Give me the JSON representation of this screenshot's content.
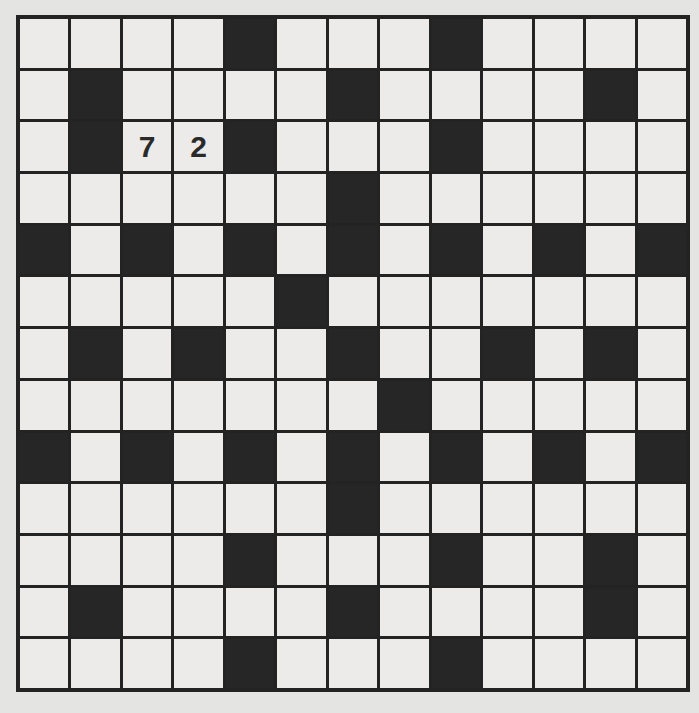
{
  "puzzle": {
    "type": "crossword",
    "rows": 13,
    "cols": 13,
    "black_cells": [
      [
        0,
        4
      ],
      [
        0,
        8
      ],
      [
        1,
        1
      ],
      [
        1,
        6
      ],
      [
        1,
        11
      ],
      [
        2,
        1
      ],
      [
        2,
        4
      ],
      [
        2,
        8
      ],
      [
        3,
        6
      ],
      [
        4,
        0
      ],
      [
        4,
        2
      ],
      [
        4,
        4
      ],
      [
        4,
        6
      ],
      [
        4,
        8
      ],
      [
        4,
        10
      ],
      [
        4,
        12
      ],
      [
        5,
        5
      ],
      [
        6,
        1
      ],
      [
        6,
        3
      ],
      [
        6,
        6
      ],
      [
        6,
        9
      ],
      [
        6,
        11
      ],
      [
        7,
        7
      ],
      [
        8,
        0
      ],
      [
        8,
        2
      ],
      [
        8,
        4
      ],
      [
        8,
        6
      ],
      [
        8,
        8
      ],
      [
        8,
        10
      ],
      [
        8,
        12
      ],
      [
        9,
        6
      ],
      [
        10,
        4
      ],
      [
        10,
        8
      ],
      [
        10,
        11
      ],
      [
        11,
        1
      ],
      [
        11,
        6
      ],
      [
        11,
        11
      ],
      [
        12,
        4
      ],
      [
        12,
        8
      ]
    ],
    "entries": [
      {
        "row": 2,
        "col": 2,
        "value": "7"
      },
      {
        "row": 2,
        "col": 3,
        "value": "2"
      }
    ],
    "colors": {
      "background": "#e4e4e2",
      "cell": "#ecebea",
      "block": "#262626",
      "grid_line": "#232323",
      "entry_text": "#2a2a2a"
    }
  }
}
